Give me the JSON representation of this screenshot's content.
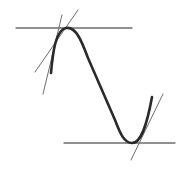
{
  "figure": {
    "colors": {
      "background": "#ffffff",
      "curve": "#2a2a2a",
      "lines": "#6e6e6e"
    },
    "curve": {
      "path": "M51,73 C53,50 56,30 66,28 C76,26 82,42 88,58 L115,120 C120,133 124,143 132,143 C140,143 146,130 152,97"
    },
    "horizontal_lines": [
      {
        "name": "max-level-line",
        "x1": 16,
        "y1": 28,
        "x2": 132,
        "y2": 28
      },
      {
        "name": "min-level-line",
        "x1": 64,
        "y1": 143,
        "x2": 175,
        "y2": 143
      }
    ],
    "tangent_lines": [
      {
        "name": "upper-shallow-tangent",
        "x1": 35,
        "y1": 72,
        "x2": 78,
        "y2": 10
      },
      {
        "name": "upper-steep-tangent",
        "x1": 43,
        "y1": 94,
        "x2": 62,
        "y2": 15
      },
      {
        "name": "lower-tangent",
        "x1": 131,
        "y1": 160,
        "x2": 163,
        "y2": 94
      }
    ]
  }
}
